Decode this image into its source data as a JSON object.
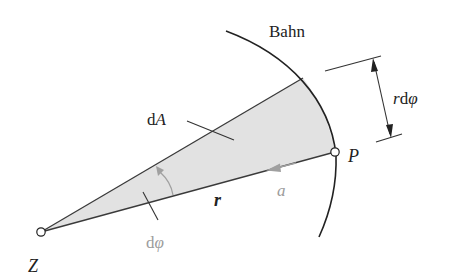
{
  "figure": {
    "type": "area-sector-diagram",
    "colors": {
      "sector_fill": "#e2e2e2",
      "line": "#333333",
      "gray_label": "#9c9c9c",
      "gray_arrow": "#a0a0a0",
      "background": "#ffffff"
    },
    "labels": {
      "path": "Bahn",
      "area_element_d": "d",
      "area_element_A": "A",
      "arc_length_r": "r",
      "arc_length_d": "d",
      "arc_length_phi": "φ",
      "radius": "r",
      "acceleration": "a",
      "angle_d": "d",
      "angle_phi": "φ",
      "center": "Z",
      "point": "P"
    },
    "points": {
      "Z": {
        "x": 41,
        "y": 232
      },
      "P": {
        "x": 335,
        "y": 152
      },
      "sector_top": {
        "x": 303,
        "y": 78
      }
    }
  }
}
